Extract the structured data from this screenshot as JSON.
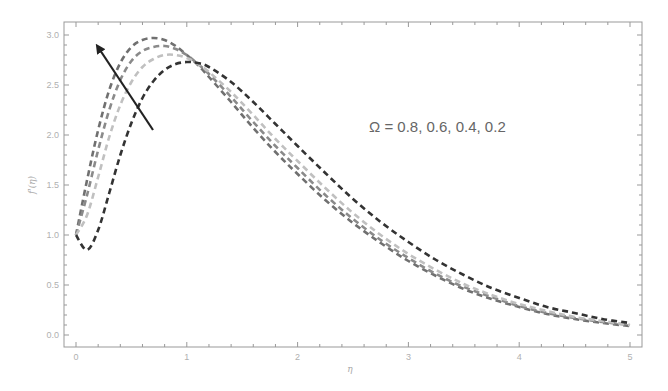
{
  "chart_data": {
    "type": "line",
    "title": "",
    "xlabel": "η",
    "ylabel": "f'(η)",
    "xlim": [
      0,
      5
    ],
    "ylim": [
      0,
      3
    ],
    "x_ticks": [
      "0",
      "1",
      "2",
      "3",
      "4",
      "5"
    ],
    "y_ticks": [
      "0.0",
      "0.5",
      "1.0",
      "1.5",
      "2.0",
      "2.5",
      "3.0"
    ],
    "grid": false,
    "legend": null,
    "annotation": {
      "text": "Ω = 0.8, 0.6, 0.4, 0.2",
      "arrow": "direction of increasing Ω (points up-left toward higher, earlier peaks)"
    },
    "line_style": "dashed",
    "x": [
      0,
      0.1,
      0.2,
      0.3,
      0.4,
      0.5,
      0.6,
      0.7,
      0.8,
      0.9,
      1.0,
      1.1,
      1.2,
      1.4,
      1.6,
      1.8,
      2.0,
      2.25,
      2.5,
      2.75,
      3.0,
      3.25,
      3.5,
      3.75,
      4.0,
      4.25,
      4.5,
      4.75,
      5.0
    ],
    "series": [
      {
        "name": "Ω = 0.8",
        "color": "#707070",
        "values": [
          1.0,
          1.55,
          2.05,
          2.45,
          2.72,
          2.88,
          2.95,
          2.97,
          2.95,
          2.89,
          2.8,
          2.7,
          2.58,
          2.33,
          2.07,
          1.83,
          1.61,
          1.35,
          1.12,
          0.92,
          0.74,
          0.59,
          0.46,
          0.36,
          0.28,
          0.21,
          0.16,
          0.12,
          0.09
        ]
      },
      {
        "name": "Ω = 0.6",
        "color": "#8a8a8a",
        "values": [
          1.0,
          1.4,
          1.85,
          2.25,
          2.55,
          2.74,
          2.84,
          2.88,
          2.89,
          2.86,
          2.8,
          2.71,
          2.61,
          2.38,
          2.13,
          1.89,
          1.67,
          1.4,
          1.16,
          0.95,
          0.77,
          0.61,
          0.48,
          0.38,
          0.29,
          0.22,
          0.17,
          0.13,
          0.1
        ]
      },
      {
        "name": "Ω = 0.4",
        "color": "#c0c0c0",
        "values": [
          1.0,
          1.2,
          1.58,
          1.98,
          2.3,
          2.53,
          2.68,
          2.76,
          2.8,
          2.8,
          2.77,
          2.71,
          2.63,
          2.43,
          2.2,
          1.96,
          1.74,
          1.47,
          1.22,
          1.0,
          0.81,
          0.65,
          0.51,
          0.4,
          0.31,
          0.24,
          0.18,
          0.14,
          0.1
        ]
      },
      {
        "name": "Ω = 0.2",
        "color": "#333333",
        "values": [
          1.0,
          0.85,
          1.05,
          1.42,
          1.8,
          2.12,
          2.37,
          2.54,
          2.65,
          2.71,
          2.73,
          2.72,
          2.68,
          2.53,
          2.33,
          2.11,
          1.89,
          1.62,
          1.36,
          1.13,
          0.93,
          0.75,
          0.6,
          0.47,
          0.37,
          0.28,
          0.22,
          0.16,
          0.12
        ]
      }
    ]
  },
  "plot_area": {
    "left": 64,
    "top": 22,
    "right": 642,
    "bottom": 347,
    "x0_px": 76,
    "x_per_unit": 110.8,
    "y0_px": 335,
    "y_per_unit": 100
  },
  "arrow": {
    "x1": 153,
    "y1": 130,
    "x2": 98,
    "y2": 47,
    "color": "#222222"
  },
  "annotation_pos": {
    "x": 369,
    "y": 132
  }
}
